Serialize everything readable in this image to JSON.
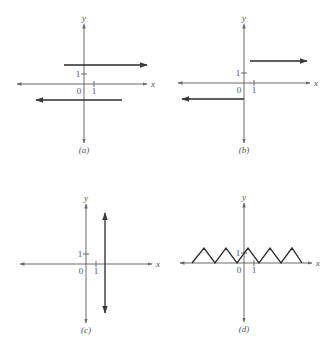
{
  "figure": {
    "panels": [
      {
        "id": "a",
        "caption": "(a)",
        "x_axis_label": "x",
        "y_axis_label": "y",
        "origin_label": "0",
        "x_tick_label": "1",
        "y_tick_label": "1",
        "description": "Two horizontal rays: y = 2 for x >= -1 (arrow right), y = -1.5 for x <= 3 (arrow left)",
        "geometry": {
          "origin": [
            84,
            84
          ],
          "x_axis": [
            17,
            147
          ],
          "y_axis": [
            24,
            143
          ],
          "unit_px": 10,
          "segments": [
            {
              "x1": 64,
              "y1": 65,
              "x2": 147,
              "y2": 65,
              "arrow": "end"
            },
            {
              "x1": 122,
              "y1": 100,
              "x2": 36,
              "y2": 100,
              "arrow": "end"
            }
          ]
        }
      },
      {
        "id": "b",
        "caption": "(b)",
        "x_axis_label": "x",
        "y_axis_label": "y",
        "origin_label": "0",
        "x_tick_label": "1",
        "y_tick_label": "1",
        "description": "Step function: y = -1.5 for x <= 0 (arrow left), y = 2.2 for x > 0.5 (arrow right)",
        "geometry": {
          "origin": [
            244,
            83
          ],
          "x_axis": [
            178,
            310
          ],
          "y_axis": [
            24,
            143
          ],
          "unit_px": 10,
          "segments": [
            {
              "x1": 250,
              "y1": 61,
              "x2": 307,
              "y2": 61,
              "arrow": "end"
            },
            {
              "x1": 244,
              "y1": 99,
              "x2": 182,
              "y2": 99,
              "arrow": "end"
            }
          ]
        }
      },
      {
        "id": "c",
        "caption": "(c)",
        "x_axis_label": "x",
        "y_axis_label": "y",
        "origin_label": "0",
        "x_tick_label": "1",
        "y_tick_label": "1",
        "description": "Vertical double-headed line at x ≈ 2 (not a function)",
        "geometry": {
          "origin": [
            86,
            264
          ],
          "x_axis": [
            20,
            152
          ],
          "y_axis": [
            204,
            323
          ],
          "unit_px": 10,
          "segments": [
            {
              "x1": 105,
              "y1": 213,
              "x2": 105,
              "y2": 313,
              "arrow": "both"
            }
          ]
        }
      },
      {
        "id": "d",
        "caption": "(d)",
        "x_axis_label": "x",
        "y_axis_label": "y",
        "origin_label": "0",
        "x_tick_label": "1",
        "y_tick_label": "1",
        "description": "Triangular (sawtooth) wave with peaks at height ~1.5",
        "geometry": {
          "origin": [
            244,
            263
          ],
          "x_axis": [
            180,
            312
          ],
          "y_axis": [
            203,
            322
          ],
          "unit_px": 10,
          "zigzag_points": [
            [
              192,
              263
            ],
            [
              204,
              248
            ],
            [
              215,
              263
            ],
            [
              226,
              248
            ],
            [
              237,
              263
            ],
            [
              248,
              248
            ],
            [
              259,
              263
            ],
            [
              270,
              248
            ],
            [
              281,
              263
            ],
            [
              292,
              248
            ],
            [
              302,
              263
            ]
          ]
        }
      }
    ]
  }
}
